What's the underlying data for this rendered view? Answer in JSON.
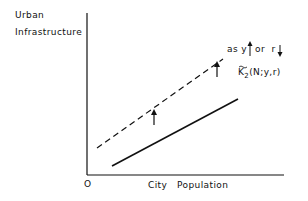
{
  "diagram": {
    "ylabel_line1": "Urban",
    "ylabel_line2": "Infrastructure",
    "xlabel": "City   Population",
    "origin": "O",
    "annotation_shift": "as y",
    "annotation_or": "or  r",
    "curve_label": "K",
    "curve_label_sub": "2",
    "curve_label_args": "(N;y,r)",
    "colors": {
      "ink": "#111111",
      "background": "#ffffff"
    }
  }
}
